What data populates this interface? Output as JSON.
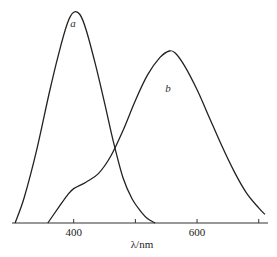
{
  "chart_data": {
    "type": "line",
    "title": "",
    "xlabel": "λ/nm",
    "ylabel": "",
    "xlim": [
      300,
      715
    ],
    "ylim": [
      0,
      1.0
    ],
    "x_ticks": [
      400,
      500,
      600,
      700
    ],
    "x_tick_labels": [
      {
        "value": 400,
        "label": "400"
      },
      {
        "value": 600,
        "label": "600"
      }
    ],
    "grid": false,
    "legend": "none",
    "series": [
      {
        "name": "a",
        "label_at": {
          "x": 399,
          "y": 0.91
        },
        "x": [
          305,
          320,
          340,
          360,
          375,
          390,
          400,
          410,
          420,
          435,
          450,
          465,
          480,
          495,
          510,
          520,
          532
        ],
        "y": [
          0.0,
          0.12,
          0.34,
          0.6,
          0.78,
          0.93,
          0.98,
          0.97,
          0.9,
          0.74,
          0.56,
          0.37,
          0.21,
          0.11,
          0.05,
          0.02,
          0.0
        ]
      },
      {
        "name": "b",
        "label_at": {
          "x": 553,
          "y": 0.61
        },
        "x": [
          358,
          375,
          390,
          400,
          420,
          440,
          460,
          480,
          500,
          520,
          540,
          555,
          565,
          580,
          600,
          620,
          640,
          660,
          680,
          700,
          710
        ],
        "y": [
          0.0,
          0.07,
          0.13,
          0.16,
          0.19,
          0.23,
          0.31,
          0.43,
          0.57,
          0.69,
          0.77,
          0.8,
          0.79,
          0.73,
          0.62,
          0.49,
          0.36,
          0.24,
          0.14,
          0.07,
          0.04
        ]
      }
    ]
  }
}
